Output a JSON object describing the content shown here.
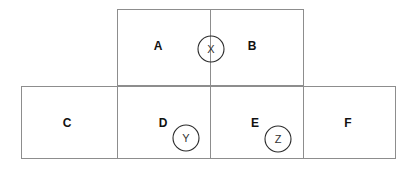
{
  "figure": {
    "background_color": "#ffffff",
    "line_color": "#8d8d8d",
    "marker_stroke_color": "#2b2b2b",
    "label_color": "#111111",
    "marker_label_color": "#333333",
    "canvas": {
      "width": 416,
      "height": 169
    }
  },
  "shapes": {
    "top_rectangle": {
      "x": 117,
      "y": 9,
      "width": 187,
      "height": 77
    },
    "bottom_rectangle": {
      "x": 21,
      "y": 86,
      "width": 375,
      "height": 73
    },
    "vertical_divider_center": {
      "x": 210,
      "y1": 9,
      "y2": 159
    },
    "vertical_divider_left": {
      "x": 117,
      "y1": 9,
      "y2": 159
    },
    "vertical_divider_right": {
      "x": 304,
      "y1": 9,
      "y2": 159
    },
    "horizontal_divider": {
      "y": 86,
      "x1": 21,
      "x2": 396
    }
  },
  "cells": [
    {
      "id": "cell-a",
      "label": "A",
      "cx": 158,
      "cy": 46
    },
    {
      "id": "cell-b",
      "label": "B",
      "cx": 252,
      "cy": 46
    },
    {
      "id": "cell-c",
      "label": "C",
      "cx": 67,
      "cy": 123
    },
    {
      "id": "cell-d",
      "label": "D",
      "cx": 163,
      "cy": 123
    },
    {
      "id": "cell-e",
      "label": "E",
      "cx": 255,
      "cy": 123
    },
    {
      "id": "cell-f",
      "label": "F",
      "cx": 348,
      "cy": 123
    }
  ],
  "markers": [
    {
      "id": "marker-x",
      "label": "X",
      "cx": 211,
      "cy": 49,
      "r": 13
    },
    {
      "id": "marker-y",
      "label": "Y",
      "cx": 186,
      "cy": 138,
      "r": 13
    },
    {
      "id": "marker-z",
      "label": "Z",
      "cx": 278,
      "cy": 139,
      "r": 13
    }
  ]
}
